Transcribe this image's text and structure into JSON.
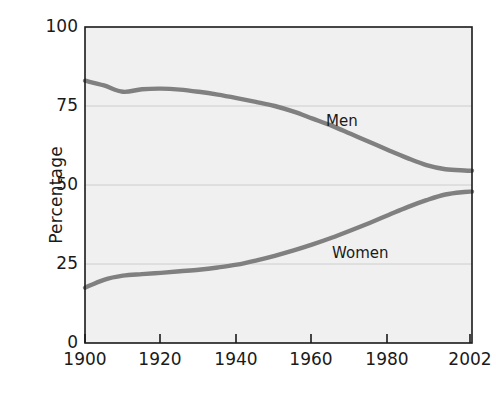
{
  "chart_data": {
    "type": "line",
    "title": "",
    "xlabel": "",
    "ylabel": "Percentage",
    "xlim": [
      1900,
      2002
    ],
    "ylim": [
      0,
      100
    ],
    "grid": true,
    "gridlines_y": [
      25,
      50,
      75
    ],
    "legend_position": "inline-labels",
    "x_tick_labels": [
      "1900",
      "1920",
      "1940",
      "1960",
      "1980",
      "2002"
    ],
    "x_ticks": [
      1900,
      1920,
      1940,
      1960,
      1980,
      2002
    ],
    "y_tick_labels": [
      "0",
      "25",
      "50",
      "75",
      "100"
    ],
    "y_ticks": [
      0,
      25,
      50,
      75,
      100
    ],
    "series": [
      {
        "name": "Men",
        "label": "Men",
        "color": "#808080",
        "x": [
          1900,
          1905,
          1910,
          1915,
          1920,
          1925,
          1930,
          1935,
          1940,
          1945,
          1950,
          1955,
          1960,
          1965,
          1970,
          1975,
          1980,
          1985,
          1990,
          1995,
          2000,
          2002
        ],
        "values": [
          83.0,
          81.5,
          79.5,
          80.3,
          80.5,
          80.2,
          79.5,
          78.6,
          77.5,
          76.3,
          75.0,
          73.2,
          71.0,
          68.8,
          66.2,
          63.6,
          61.0,
          58.5,
          56.3,
          55.0,
          54.6,
          54.5
        ]
      },
      {
        "name": "Women",
        "label": "Women",
        "color": "#808080",
        "x": [
          1900,
          1905,
          1910,
          1915,
          1920,
          1925,
          1930,
          1935,
          1940,
          1945,
          1950,
          1955,
          1960,
          1965,
          1970,
          1975,
          1980,
          1985,
          1990,
          1995,
          2000,
          2002
        ],
        "values": [
          17.5,
          20.0,
          21.3,
          21.8,
          22.2,
          22.7,
          23.2,
          23.9,
          24.8,
          26.1,
          27.6,
          29.3,
          31.2,
          33.3,
          35.6,
          38.0,
          40.5,
          43.0,
          45.2,
          47.0,
          47.8,
          47.9
        ]
      }
    ],
    "annotations": [
      {
        "text": "Men",
        "x_px": 326,
        "y_px": 112
      },
      {
        "text": "Women",
        "x_px": 332,
        "y_px": 244
      }
    ]
  },
  "axes": {
    "y_title": "Percentage",
    "y_ticks": [
      {
        "label": "100",
        "y_px": 27
      },
      {
        "label": "75",
        "y_px": 106
      },
      {
        "label": "50",
        "y_px": 185
      },
      {
        "label": "25",
        "y_px": 264
      },
      {
        "label": "0",
        "y_px": 343
      }
    ],
    "x_ticks": [
      {
        "label": "1900",
        "x_px": 85
      },
      {
        "label": "1920",
        "x_px": 160
      },
      {
        "label": "1940",
        "x_px": 236
      },
      {
        "label": "1960",
        "x_px": 311
      },
      {
        "label": "1980",
        "x_px": 387
      },
      {
        "label": "2002",
        "x_px": 470
      }
    ]
  },
  "style": {
    "plot_background": "#f0f0f0",
    "axis_color": "#1a1a1a",
    "grid_color": "#c8c8c8",
    "line_color": "#808080",
    "text_color": "#1a1a1a"
  }
}
